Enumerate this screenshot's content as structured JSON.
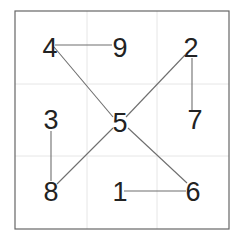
{
  "diagram": {
    "colors": {
      "background": "#ffffff",
      "frame": "#666666",
      "grid": "#e6e6e6",
      "edge": "#6e6e6e",
      "text": "#222222"
    },
    "frame": {
      "x": 15,
      "y": 11,
      "w": 214,
      "h": 218
    },
    "grid_lines": {
      "vertical_x": [
        87,
        157
      ],
      "horizontal_y": [
        84,
        156
      ]
    },
    "cells": [
      {
        "row": 0,
        "col": 0,
        "label": "4",
        "cx": 50,
        "cy": 48
      },
      {
        "row": 0,
        "col": 1,
        "label": "9",
        "cx": 120,
        "cy": 48
      },
      {
        "row": 0,
        "col": 2,
        "label": "2",
        "cx": 191,
        "cy": 48
      },
      {
        "row": 1,
        "col": 0,
        "label": "3",
        "cx": 51,
        "cy": 120
      },
      {
        "row": 1,
        "col": 1,
        "label": "5",
        "cx": 120,
        "cy": 123
      },
      {
        "row": 1,
        "col": 2,
        "label": "7",
        "cx": 195,
        "cy": 120
      },
      {
        "row": 2,
        "col": 0,
        "label": "8",
        "cx": 51,
        "cy": 192
      },
      {
        "row": 2,
        "col": 1,
        "label": "1",
        "cx": 120,
        "cy": 192
      },
      {
        "row": 2,
        "col": 2,
        "label": "6",
        "cx": 193,
        "cy": 192
      }
    ],
    "edges": [
      {
        "from": "4",
        "to": "9",
        "x1": 55,
        "y1": 45,
        "x2": 112,
        "y2": 45
      },
      {
        "from": "4",
        "to": "5",
        "x1": 54,
        "y1": 47,
        "x2": 113,
        "y2": 117
      },
      {
        "from": "2",
        "to": "5",
        "x1": 185,
        "y1": 55,
        "x2": 126,
        "y2": 117
      },
      {
        "from": "2",
        "to": "7",
        "x1": 192,
        "y1": 58,
        "x2": 192,
        "y2": 110
      },
      {
        "from": "3",
        "to": "8",
        "x1": 51,
        "y1": 131,
        "x2": 51,
        "y2": 181
      },
      {
        "from": "8",
        "to": "5",
        "x1": 57,
        "y1": 184,
        "x2": 113,
        "y2": 128
      },
      {
        "from": "5",
        "to": "6",
        "x1": 128,
        "y1": 128,
        "x2": 187,
        "y2": 183
      },
      {
        "from": "1",
        "to": "6",
        "x1": 124,
        "y1": 191,
        "x2": 186,
        "y2": 191
      }
    ]
  }
}
